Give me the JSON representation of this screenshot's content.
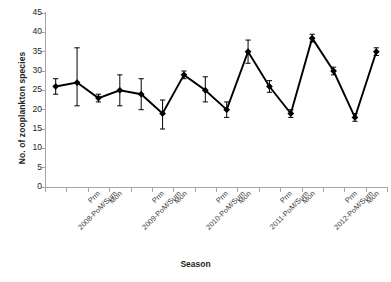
{
  "chart_data": {
    "type": "line",
    "title": "",
    "xlabel": "Season",
    "ylabel": "No. of zooplankton species",
    "ylim": [
      0,
      45
    ],
    "yticks": [
      0,
      5,
      10,
      15,
      20,
      25,
      30,
      35,
      40,
      45
    ],
    "grid": false,
    "legend": null,
    "marker": "diamond",
    "error_bars": true,
    "series_color": "#000000",
    "axis_color": "#a6a6a6",
    "categories": [
      "2008-PoM/Sum",
      "Prm",
      "Mon",
      "2009-PoM/Sum",
      "Prm",
      "Mon",
      "2010-PoM/Sum",
      "Prm",
      "Mon",
      "2011-PoM/Sum",
      "Prm",
      "Mon",
      "2012-PoM/Sum",
      "Prm",
      "Mon",
      "2013-PoM/Sum"
    ],
    "values": [
      26,
      27,
      23,
      25,
      24,
      19,
      29,
      25,
      20,
      35,
      26,
      19,
      38.5,
      30,
      18,
      35
    ],
    "errors_upper": [
      28,
      36,
      24,
      29,
      28,
      22.5,
      30,
      28.5,
      22,
      38,
      27.5,
      20,
      39.5,
      31,
      19,
      36
    ],
    "errors_lower": [
      24,
      21,
      22,
      21,
      20,
      15,
      28,
      22,
      18,
      32,
      24.5,
      18,
      37.5,
      29,
      17,
      34
    ]
  },
  "axis": {
    "ylabel": "No. of zooplankton species",
    "xlabel": "Season"
  }
}
